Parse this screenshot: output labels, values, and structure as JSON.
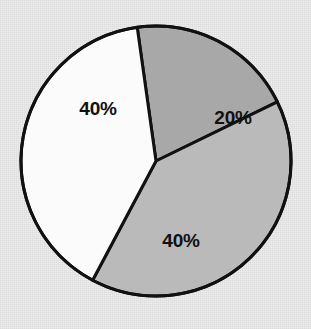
{
  "chart_data": {
    "type": "pie",
    "title": "",
    "subtitle": "",
    "xlabel": "",
    "ylabel": "",
    "grid": false,
    "legend": "none",
    "labels_shown_on_slices": true,
    "units": "percent",
    "total": 100,
    "center": {
      "x": 156,
      "y": 161
    },
    "radius": 135,
    "start_angle_deg": -8,
    "direction": "clockwise",
    "outline_color": "#111111",
    "outline_width": 3,
    "background_color": "#ededed",
    "categories": [
      "20%",
      "40%",
      "40%"
    ],
    "values": [
      20,
      40,
      40
    ],
    "slices": [
      {
        "label": "20%",
        "value": 20,
        "color": "#a8a8a8",
        "start_angle_deg": -8,
        "end_angle_deg": 64,
        "sweep_deg": 72,
        "label_x": 233,
        "label_y": 117
      },
      {
        "label": "40%",
        "value": 40,
        "color": "#bababa",
        "start_angle_deg": 64,
        "end_angle_deg": 208,
        "sweep_deg": 144,
        "label_x": 181,
        "label_y": 240
      },
      {
        "label": "40%",
        "value": 40,
        "color": "#fbfbfb",
        "start_angle_deg": 208,
        "end_angle_deg": 352,
        "sweep_deg": 144,
        "label_x": 98,
        "label_y": 108
      }
    ]
  }
}
